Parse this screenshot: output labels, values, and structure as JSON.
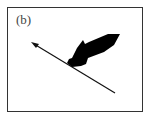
{
  "panel": {
    "label": "(b)"
  },
  "colors": {
    "stroke": "#111111",
    "fill": "#000000",
    "border": "#333333"
  }
}
